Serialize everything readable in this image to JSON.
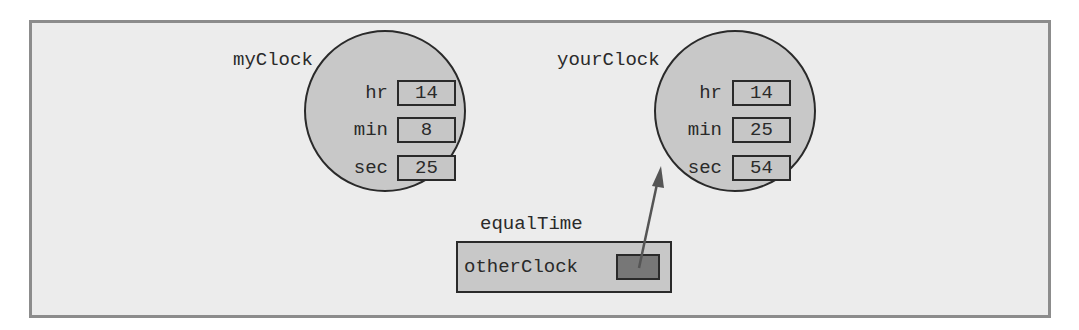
{
  "diagram": {
    "objects": [
      {
        "name": "myClock",
        "fields": [
          {
            "name": "hr",
            "value": "14"
          },
          {
            "name": "min",
            "value": "8"
          },
          {
            "name": "sec",
            "value": "25"
          }
        ]
      },
      {
        "name": "yourClock",
        "fields": [
          {
            "name": "hr",
            "value": "14"
          },
          {
            "name": "min",
            "value": "25"
          },
          {
            "name": "sec",
            "value": "54"
          }
        ]
      }
    ],
    "method_frame": {
      "name": "equalTime",
      "parameter": "otherClock",
      "parameter_refers_to": "yourClock"
    },
    "colors": {
      "frame_background": "#ececec",
      "frame_border": "#8c8c8c",
      "object_fill": "#c8c8c8",
      "reference_fill": "#777777",
      "outline": "#2a2a2a",
      "arrow": "#555555"
    }
  }
}
